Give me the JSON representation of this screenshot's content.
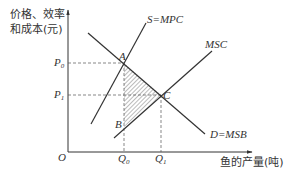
{
  "diagram": {
    "y_axis_label_line1": "价格、效率",
    "y_axis_label_line2": "和成本(元)",
    "x_axis_label": "鱼的产量(吨)",
    "origin_label": "O",
    "p0_label": "P",
    "p0_sub": "0",
    "p1_label": "P",
    "p1_sub": "1",
    "q0_label": "Q",
    "q0_sub": "0",
    "q1_label": "Q",
    "q1_sub": "1",
    "point_a": "A",
    "point_b": "B",
    "point_c": "C",
    "curve_supply": "S=MPC",
    "curve_msc": "MSC",
    "curve_demand": "D=MSB",
    "colors": {
      "line": "#333333",
      "dashed": "#555555",
      "hatch": "#555555"
    }
  }
}
